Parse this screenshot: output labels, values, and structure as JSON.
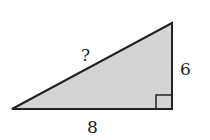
{
  "diagram": {
    "type": "right-triangle",
    "fill_color": "#d4d4d4",
    "stroke_color": "#222222",
    "labels": {
      "hypotenuse": "?",
      "vertical_leg": "6",
      "horizontal_leg": "8"
    },
    "right_angle_marker": true
  }
}
